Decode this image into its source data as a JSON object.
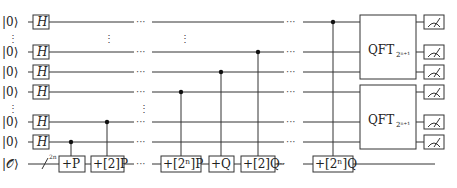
{
  "inputs": {
    "qubit_ket": "|0⟩",
    "oracle_ket": "|𝒪⟩",
    "oracle_register_size": "2n"
  },
  "gates": {
    "hadamard": "H",
    "add_p": "+P",
    "add_2p": "+[2]P",
    "add_2np": "+[2ⁿ]P",
    "add_q": "+Q",
    "add_2q": "+[2]Q",
    "add_2nq": "+[2ⁿ]Q",
    "qft_upper": "QFT",
    "qft_upper_sub": "2ⁿ⁺¹",
    "qft_lower": "QFT",
    "qft_lower_sub": "2ⁿ⁺¹"
  },
  "ellipsis": "···",
  "vdots": "⋮",
  "measurements": {
    "count": 6,
    "icon": "meter-icon"
  }
}
